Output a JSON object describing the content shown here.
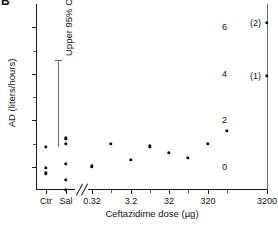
{
  "panel": {
    "label": "B"
  },
  "chart_data": {
    "type": "scatter",
    "title": "",
    "xlabel": "Ceftazidime dose (µg)",
    "ylabel": "AD (liters/hours)",
    "ylim": [
      -1.0,
      7.0
    ],
    "yticks": [
      0,
      2,
      4,
      6
    ],
    "ytick_labels": [
      "0",
      "2",
      "4",
      "6"
    ],
    "yminor_ticks": [
      1,
      3,
      5
    ],
    "grid": false,
    "legend": "none",
    "axis_break": {
      "present": true,
      "between": [
        "Sal",
        "0.32"
      ]
    },
    "categories": [
      "Ctr",
      "Sal",
      "0.32",
      "3.2",
      "32",
      "320",
      "3200"
    ],
    "xtick_labels": [
      "Ctr",
      "Sal",
      "0.32",
      "3.2",
      "32",
      "320",
      "3200"
    ],
    "annotations": [
      {
        "name": "upper-95-ci",
        "text": "Upper 95% CI",
        "value": 0.85
      },
      {
        "name": "point-label-2",
        "text": "(2)",
        "x": "3200",
        "y": 6.2
      },
      {
        "name": "point-label-1",
        "text": "(1)",
        "x": "3200",
        "y": 3.9
      }
    ],
    "points": [
      {
        "x": "Ctr",
        "y": 0.85
      },
      {
        "x": "Ctr",
        "y": -0.05
      },
      {
        "x": "Ctr",
        "y": -0.28
      },
      {
        "x": "Sal",
        "y": 1.22
      },
      {
        "x": "Sal",
        "y": 1.0
      },
      {
        "x": "Sal",
        "y": 0.12
      },
      {
        "x": "Sal",
        "y": -0.55
      },
      {
        "x": "Sal",
        "y": -1.0
      },
      {
        "x": "0.32",
        "y": 0.02
      },
      {
        "x": "1.0",
        "y": 1.0
      },
      {
        "x": "3.2",
        "y": 0.3
      },
      {
        "x": "10",
        "y": 0.88
      },
      {
        "x": "32",
        "y": 0.6
      },
      {
        "x": "100",
        "y": 0.38
      },
      {
        "x": "320",
        "y": 1.0
      },
      {
        "x": "1000",
        "y": 1.55
      },
      {
        "x": "3200",
        "y": 3.9
      },
      {
        "x": "3200",
        "y": 6.2
      }
    ]
  }
}
